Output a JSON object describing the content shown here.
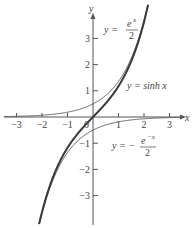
{
  "chart_data": {
    "type": "line",
    "title": "",
    "xlabel": "x",
    "ylabel": "y",
    "xlim": [
      -3.5,
      3.5
    ],
    "ylim": [
      -4.1,
      4.3
    ],
    "grid": false,
    "legend": "none (inline annotations)",
    "x_ticks": [
      -3,
      -2,
      -1,
      0,
      1,
      2,
      3
    ],
    "x_tick_labels": [
      "−3",
      "−2",
      "−1",
      "0",
      "1",
      "2",
      "3"
    ],
    "y_ticks": [
      -3,
      -2,
      -1,
      1,
      2,
      3
    ],
    "y_tick_labels": [
      "−3",
      "−2",
      "−1",
      "1",
      "2",
      "3"
    ],
    "series": [
      {
        "name": "y = sinh x",
        "style": "thick",
        "x": [
          -2.5,
          -2,
          -1.5,
          -1,
          -0.5,
          0,
          0.5,
          1,
          1.5,
          2,
          2.5
        ],
        "y": [
          -6.05,
          -3.63,
          -2.13,
          -1.18,
          -0.52,
          0,
          0.52,
          1.18,
          2.13,
          3.63,
          6.05
        ]
      },
      {
        "name": "y = e^x / 2",
        "style": "thin",
        "x": [
          -3.5,
          -3,
          -2,
          -1,
          0,
          1,
          1.5,
          2,
          2.1
        ],
        "y": [
          0.015,
          0.025,
          0.068,
          0.184,
          0.5,
          1.359,
          2.241,
          3.695,
          4.08
        ]
      },
      {
        "name": "y = −e^(−x) / 2",
        "style": "thin",
        "x": [
          -2.1,
          -2,
          -1.5,
          -1,
          0,
          1,
          2,
          3,
          3.5
        ],
        "y": [
          -4.08,
          -3.695,
          -2.241,
          -1.359,
          -0.5,
          -0.184,
          -0.068,
          -0.025,
          -0.015
        ]
      }
    ],
    "annotations": [
      {
        "text": "y = e^x / 2",
        "near": [
          1.2,
          3.3
        ]
      },
      {
        "text": "y = sinh x",
        "near": [
          1.9,
          1.1
        ]
      },
      {
        "text": "y = −e^(−x) / 2",
        "near": [
          1.4,
          -1.0
        ]
      }
    ]
  },
  "labels": {
    "x_axis": "x",
    "y_axis": "y",
    "origin": "0",
    "ann_ex": {
      "lhs": "y = ",
      "num_base": "e",
      "num_exp": "x",
      "den": "2"
    },
    "ann_sinh": {
      "lhs": "y = sinh ",
      "var": "x"
    },
    "ann_enx": {
      "lhs": "y = − ",
      "num_base": "e",
      "num_exp": "−x",
      "den": "2"
    }
  }
}
